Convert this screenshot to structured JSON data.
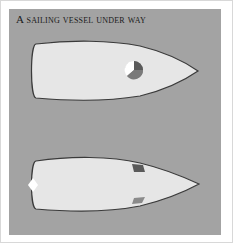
{
  "figure": {
    "title": "A sailing vessel under way",
    "background_color": "#a3a3a3",
    "hull_color": "#e6e6e6",
    "views": [
      {
        "name": "top-vessel",
        "lights": [
          "masthead/sidelight combined lantern (white, green, red sectors)"
        ]
      },
      {
        "name": "bottom-vessel",
        "lights": [
          "stern light (white)",
          "starboard sidelight (green)",
          "port sidelight (red)"
        ]
      }
    ]
  }
}
